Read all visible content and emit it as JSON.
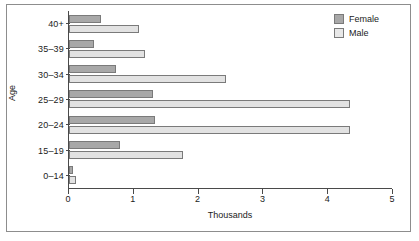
{
  "chart_data": {
    "type": "bar",
    "orientation": "horizontal",
    "title": "",
    "xlabel": "Thousands",
    "ylabel": "Age",
    "categories": [
      "0–14",
      "15–19",
      "20–24",
      "25–29",
      "30–34",
      "35–39",
      "40+"
    ],
    "categories_top_to_bottom": [
      "40+",
      "35–39",
      "30–34",
      "25–29",
      "20–24",
      "15–19",
      "0–14"
    ],
    "series": [
      {
        "name": "Female",
        "color": "#a8a8a8",
        "values": [
          0.06,
          0.79,
          1.33,
          1.3,
          0.73,
          0.38,
          0.49
        ]
      },
      {
        "name": "Male",
        "color": "#e2e2e2",
        "values": [
          0.11,
          1.76,
          4.34,
          4.33,
          2.42,
          1.17,
          1.08
        ]
      }
    ],
    "xlim": [
      0,
      5
    ],
    "xticks": [
      0,
      1,
      2,
      3,
      4,
      5
    ],
    "xtick_labels": [
      "0",
      "1",
      "2",
      "3",
      "4",
      "5"
    ],
    "grid": false,
    "legend_position": "top-right",
    "legend_entries": [
      "Female",
      "Male"
    ]
  },
  "axes": {
    "y_title": "Age",
    "x_title": "Thousands"
  },
  "legend": {
    "items": [
      {
        "label": "Female",
        "swatch": "female"
      },
      {
        "label": "Male",
        "swatch": "male"
      }
    ]
  }
}
